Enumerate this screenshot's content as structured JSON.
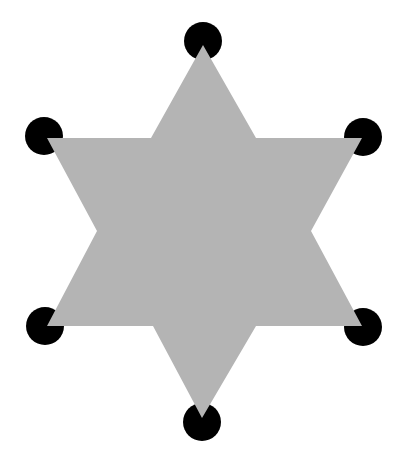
{
  "figure": {
    "background": "#ffffff",
    "star": {
      "fill": "#b4b4b4",
      "points": [
        [
          203,
          45
        ],
        [
          256,
          138
        ],
        [
          362,
          138
        ],
        [
          311,
          231
        ],
        [
          362,
          326
        ],
        [
          256,
          326
        ],
        [
          202,
          418
        ],
        [
          153,
          326
        ],
        [
          47,
          326
        ],
        [
          97,
          231
        ],
        [
          47,
          138
        ],
        [
          151,
          138
        ]
      ]
    },
    "circles": {
      "fill": "#000000",
      "radius": 19,
      "items": [
        {
          "name": "top",
          "cx": 203,
          "cy": 41
        },
        {
          "name": "upper-right",
          "cx": 363,
          "cy": 137
        },
        {
          "name": "lower-right",
          "cx": 363,
          "cy": 327
        },
        {
          "name": "bottom",
          "cx": 202,
          "cy": 422
        },
        {
          "name": "lower-left",
          "cx": 45,
          "cy": 326
        },
        {
          "name": "upper-left",
          "cx": 44,
          "cy": 136
        }
      ]
    }
  }
}
